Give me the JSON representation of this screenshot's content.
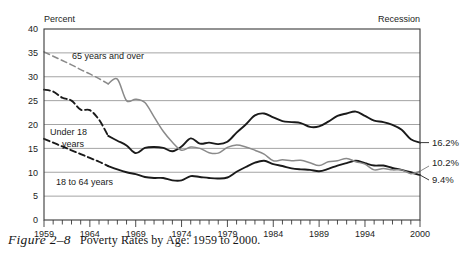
{
  "header": {
    "y_axis_title": "Percent",
    "recession_note": "Recession"
  },
  "caption": {
    "figure_number": "Figure 2–8",
    "title": "Poverty Rates by Age: 1959 to 2000."
  },
  "annotations": {
    "label_65plus": "65 years and over",
    "label_under18_line1": "Under 18",
    "label_under18_line2": "years",
    "label_18to64": "18 to 64 years"
  },
  "end_labels": {
    "under18": "16.2%",
    "age65plus": "10.2%",
    "age18to64": "9.4%"
  },
  "colors": {
    "under18": "#1a1a1a",
    "age18to64": "#1a1a1a",
    "age65plus": "#8a8a8a",
    "grid": "#9a9a9a",
    "frame": "#3a3a3a",
    "text": "#1d1d1d"
  },
  "chart_data": {
    "type": "line",
    "title": "Poverty Rates by Age: 1959 to 2000",
    "xlabel": "",
    "ylabel": "Percent",
    "xlim": [
      1959,
      2000
    ],
    "ylim": [
      0,
      40
    ],
    "yticks": [
      0,
      5,
      10,
      15,
      20,
      25,
      30,
      35,
      40
    ],
    "xtick_labels": [
      "1959",
      "1964",
      "1969",
      "1974",
      "1979",
      "1984",
      "1989",
      "1994",
      "2000"
    ],
    "xtick_label_years": [
      1959,
      1964,
      1969,
      1974,
      1979,
      1984,
      1989,
      1994,
      2000
    ],
    "minor_tick_interval": 1,
    "grid": "horizontal",
    "legend": "inline-annotations",
    "x": [
      1959,
      1960,
      1961,
      1962,
      1963,
      1964,
      1965,
      1966,
      1967,
      1968,
      1969,
      1970,
      1971,
      1972,
      1973,
      1974,
      1975,
      1976,
      1977,
      1978,
      1979,
      1980,
      1981,
      1982,
      1983,
      1984,
      1985,
      1986,
      1987,
      1988,
      1989,
      1990,
      1991,
      1992,
      1993,
      1994,
      1995,
      1996,
      1997,
      1998,
      1999,
      2000
    ],
    "series": [
      {
        "name": "Under 18 years",
        "color": "#1a1a1a",
        "style": "solid-with-dashed-start",
        "dashed_through_year": 1966,
        "end_value": 16.2,
        "values": [
          27.3,
          26.9,
          25.6,
          25.0,
          23.1,
          23.0,
          21.0,
          17.6,
          16.6,
          15.6,
          14.0,
          15.1,
          15.3,
          15.1,
          14.4,
          15.4,
          17.1,
          16.0,
          16.2,
          15.9,
          16.4,
          18.3,
          20.0,
          21.9,
          22.3,
          21.5,
          20.7,
          20.5,
          20.3,
          19.5,
          19.6,
          20.6,
          21.8,
          22.3,
          22.7,
          21.8,
          20.8,
          20.5,
          19.9,
          18.9,
          16.9,
          16.2
        ]
      },
      {
        "name": "18 to 64 years",
        "color": "#1a1a1a",
        "style": "solid-with-dashed-start",
        "dashed_through_year": 1966,
        "end_value": 9.4,
        "values": [
          17.0,
          16.2,
          15.4,
          14.6,
          13.8,
          13.0,
          12.2,
          11.3,
          10.6,
          10.0,
          9.6,
          9.0,
          8.8,
          8.8,
          8.3,
          8.3,
          9.2,
          9.0,
          8.8,
          8.7,
          8.9,
          10.1,
          11.1,
          12.0,
          12.4,
          11.7,
          11.3,
          10.8,
          10.6,
          10.5,
          10.2,
          10.7,
          11.4,
          11.9,
          12.4,
          11.9,
          11.4,
          11.4,
          10.9,
          10.5,
          10.0,
          9.4
        ]
      },
      {
        "name": "65 years and over",
        "color": "#8a8a8a",
        "style": "solid-with-dashed-start",
        "dashed_through_year": 1966,
        "end_value": 10.2,
        "values": [
          35.2,
          34.3,
          33.4,
          32.5,
          31.5,
          30.6,
          29.6,
          28.5,
          29.5,
          25.0,
          25.3,
          24.6,
          21.6,
          18.6,
          16.3,
          14.6,
          15.3,
          15.0,
          14.1,
          14.0,
          15.2,
          15.7,
          15.3,
          14.6,
          13.8,
          12.4,
          12.6,
          12.4,
          12.5,
          12.0,
          11.4,
          12.2,
          12.4,
          12.9,
          12.2,
          11.7,
          10.5,
          10.8,
          10.5,
          10.5,
          9.7,
          10.2
        ]
      }
    ]
  }
}
